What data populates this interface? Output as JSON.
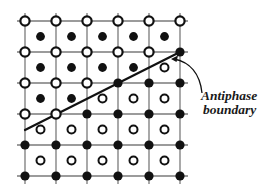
{
  "diagram": {
    "type": "crystal-lattice",
    "annotation": {
      "line1": "Antiphase",
      "line2": "boundary"
    },
    "grid": {
      "x0": 25,
      "y0": 21,
      "spacing": 31,
      "cols": 6,
      "rows": 6,
      "line_color": "#7a7a7a"
    },
    "corner_sites": [
      [
        "open",
        "open",
        "open",
        "open",
        "open",
        "open"
      ],
      [
        "open",
        "open",
        "open",
        "open",
        "open",
        "filled"
      ],
      [
        "open",
        "open",
        "open",
        "filled",
        "filled",
        "filled"
      ],
      [
        "open",
        "open",
        "filled",
        "filled",
        "filled",
        "filled"
      ],
      [
        "filled",
        "filled",
        "filled",
        "filled",
        "filled",
        "filled"
      ],
      [
        "filled",
        "filled",
        "filled",
        "filled",
        "filled",
        "filled"
      ]
    ],
    "center_sites": [
      [
        "filled",
        "filled",
        "filled",
        "filled",
        "filled"
      ],
      [
        "filled",
        "filled",
        "filled",
        "filled",
        "open"
      ],
      [
        "filled",
        "filled",
        "open",
        "open",
        "open"
      ],
      [
        "open",
        "open",
        "open",
        "open",
        "open"
      ],
      [
        "open",
        "open",
        "open",
        "open",
        "open"
      ]
    ],
    "boundary_line": {
      "x1": 25,
      "y1": 130,
      "x2": 180,
      "y2": 52
    },
    "colors": {
      "atom": "#111111",
      "background": "#ffffff"
    }
  }
}
